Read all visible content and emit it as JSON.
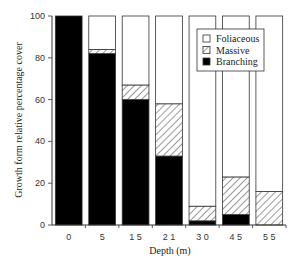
{
  "chart_data": {
    "type": "bar",
    "stacked": true,
    "title": "",
    "xlabel": "Depth (m)",
    "ylabel": "Growth form relative percentage cover",
    "ylim": [
      0,
      100
    ],
    "yticks": [
      0,
      20,
      40,
      60,
      80,
      100
    ],
    "grid": false,
    "legend_position": "upper right",
    "categories": [
      "0",
      "5",
      "15",
      "21",
      "30",
      "45",
      "55"
    ],
    "series": [
      {
        "name": "Branching",
        "fill": "#000000",
        "pattern": "solid",
        "values": [
          100,
          82,
          60,
          33,
          2,
          5,
          0
        ]
      },
      {
        "name": "Massive",
        "fill": "#ffffff",
        "pattern": "hatch",
        "values": [
          0,
          2,
          7,
          25,
          7,
          18,
          16
        ]
      },
      {
        "name": "Foliaceous",
        "fill": "#ffffff",
        "pattern": "open",
        "values": [
          0,
          16,
          33,
          42,
          91,
          77,
          84
        ]
      }
    ],
    "legend": [
      "Foliaceous",
      "Massive",
      "Branching"
    ]
  }
}
